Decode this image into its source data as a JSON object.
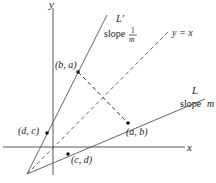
{
  "axes": {
    "x_label": "x",
    "y_label": "y"
  },
  "lines": {
    "L_prime": {
      "name": "L′",
      "slope_text": "slope",
      "slope_num": "1",
      "slope_den": "m"
    },
    "L": {
      "name": "L",
      "slope_text": "slope",
      "slope_var": "m"
    },
    "identity": {
      "label": "y = x"
    }
  },
  "points": {
    "ba": {
      "label": "(b, a)"
    },
    "ab": {
      "label": "(a, b)"
    },
    "dc": {
      "label": "(d, c)"
    },
    "cd": {
      "label": "(c, d)"
    }
  },
  "colors": {
    "ink": "#1a1a1a",
    "line": "#444444",
    "background": "#ffffff"
  }
}
